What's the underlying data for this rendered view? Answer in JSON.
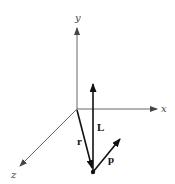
{
  "diagram": {
    "axes": [
      {
        "id": "x",
        "label": "x"
      },
      {
        "id": "y",
        "label": "y"
      },
      {
        "id": "z",
        "label": "z"
      }
    ],
    "vectors": [
      {
        "id": "L",
        "label": "L",
        "meaning": "angular momentum"
      },
      {
        "id": "r",
        "label": "r",
        "meaning": "position vector"
      },
      {
        "id": "p",
        "label": "p",
        "meaning": "linear momentum"
      }
    ],
    "colors": {
      "axis": "#555555",
      "vector": "#111111",
      "background": "#ffffff"
    }
  }
}
